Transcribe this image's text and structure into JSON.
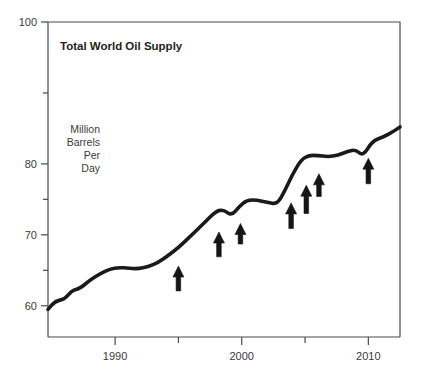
{
  "chart_data": {
    "type": "line",
    "title": "Total World Oil Supply",
    "ylabel_lines": [
      "Million",
      "Barrels",
      "Per",
      "Day"
    ],
    "ylabel": "Million Barrels Per Day",
    "xlabel": "",
    "xlim": [
      1984.7,
      2012.5
    ],
    "ylim": [
      55.6,
      100
    ],
    "grid": false,
    "legend": "none",
    "y_major_ticks": [
      100,
      80,
      70,
      60
    ],
    "y_major_tick_labels": [
      "100",
      "80",
      "70",
      "60"
    ],
    "y_minor_ticks": [
      90,
      75,
      65
    ],
    "x_major_ticks": [
      1990,
      2000,
      2010
    ],
    "x_major_tick_labels": [
      "1990",
      "2000",
      "2010"
    ],
    "x_minor_ticks": [
      1995,
      2005
    ],
    "series": [
      {
        "name": "Total World Oil Supply",
        "color": "#1a1a1a",
        "x": [
          1984.7,
          1985.3,
          1986.0,
          1986.6,
          1987.2,
          1988.0,
          1988.8,
          1989.6,
          1990.3,
          1991.0,
          1991.8,
          1992.6,
          1993.4,
          1994.2,
          1995.0,
          1996.0,
          1997.0,
          1998.0,
          1998.6,
          1999.2,
          1999.8,
          2000.4,
          2001.2,
          2002.0,
          2002.8,
          2003.4,
          2004.0,
          2004.7,
          2005.3,
          2006.0,
          2006.8,
          2007.6,
          2008.4,
          2009.0,
          2009.6,
          2010.3,
          2011.2,
          2012.0,
          2012.5
        ],
        "y": [
          59.5,
          60.7,
          60.9,
          62.2,
          62.4,
          63.6,
          64.5,
          65.2,
          65.4,
          65.3,
          65.2,
          65.5,
          66.1,
          67.1,
          68.2,
          69.9,
          71.6,
          73.4,
          73.5,
          72.7,
          74.0,
          74.9,
          74.9,
          74.6,
          74.3,
          76.2,
          78.5,
          80.6,
          81.2,
          81.2,
          81.0,
          81.2,
          81.8,
          82.0,
          81.1,
          83.2,
          83.8,
          84.6,
          85.2
        ],
        "units": "million barrels per day"
      }
    ],
    "annotations": [
      {
        "type": "up-arrow",
        "x": 1995.0,
        "y_tip": 65.6,
        "y_base": 62.1,
        "label": "arrow-1995"
      },
      {
        "type": "up-arrow",
        "x": 1998.2,
        "y_tip": 70.4,
        "y_base": 66.9,
        "label": "arrow-1998"
      },
      {
        "type": "up-arrow",
        "x": 1999.9,
        "y_tip": 71.6,
        "y_base": 68.7,
        "label": "arrow-2000"
      },
      {
        "type": "up-arrow",
        "x": 2003.9,
        "y_tip": 74.5,
        "y_base": 70.9,
        "label": "arrow-2004"
      },
      {
        "type": "up-arrow",
        "x": 2005.1,
        "y_tip": 77.0,
        "y_base": 73.0,
        "label": "arrow-2005"
      },
      {
        "type": "up-arrow",
        "x": 2006.1,
        "y_tip": 78.6,
        "y_base": 75.4,
        "label": "arrow-2006"
      },
      {
        "type": "up-arrow",
        "x": 2010.0,
        "y_tip": 80.8,
        "y_base": 77.2,
        "label": "arrow-2010"
      }
    ],
    "style": {
      "line_width": 3.6,
      "axis_color": "#4a4a4a",
      "arrow_color": "#151515",
      "background": "#ffffff"
    }
  }
}
